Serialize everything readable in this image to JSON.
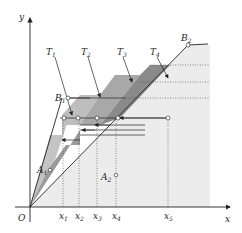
{
  "axes": {
    "x_label": "x",
    "y_label": "y",
    "origin_label": "O"
  },
  "x_ticks": [
    {
      "label": "x",
      "sub": "1",
      "x": 63
    },
    {
      "label": "x",
      "sub": "2",
      "x": 79
    },
    {
      "label": "x",
      "sub": "3",
      "x": 97
    },
    {
      "label": "x",
      "sub": "4",
      "x": 116
    },
    {
      "label": "x",
      "sub": "5",
      "x": 168
    }
  ],
  "bands": [
    {
      "label": "T",
      "sub": "1"
    },
    {
      "label": "T",
      "sub": "2"
    },
    {
      "label": "T",
      "sub": "3"
    },
    {
      "label": "T",
      "sub": "4"
    }
  ],
  "points": {
    "A1": {
      "label": "A",
      "sub": "1"
    },
    "A2": {
      "label": "A",
      "sub": "2"
    },
    "B1": {
      "label": "B",
      "sub": "1"
    },
    "B2": {
      "label": "B",
      "sub": "2"
    }
  },
  "colors": {
    "background_region": "#ececec",
    "band_light": "#c4c4c4",
    "band_mid": "#a8a8a8",
    "band_dark": "#8a8a8a",
    "line": "#222222"
  }
}
